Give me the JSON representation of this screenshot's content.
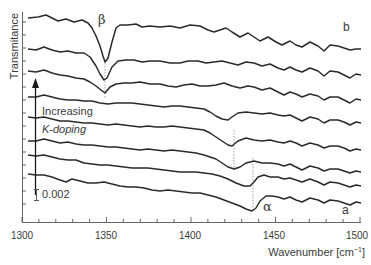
{
  "chart_data": {
    "type": "line",
    "title": "",
    "xlabel": "Wavenumber [cm−1]",
    "ylabel": "Transmitance",
    "xlim": [
      1300,
      1500
    ],
    "x_ticks": [
      1300,
      1350,
      1400,
      1450,
      1500
    ],
    "y_ticks": "unlabeled",
    "scale_bar": "0.002",
    "grid": false,
    "legend": null,
    "annotations": [
      {
        "text": "β",
        "x": 1350,
        "note": "peak near 1350 cm-1 in upper (high K-doping) spectra"
      },
      {
        "text": "α",
        "x": 1440,
        "note": "peak near 1440 cm-1 in lower (low K-doping) spectra"
      },
      {
        "text": "a",
        "position": "bottom spectrum label"
      },
      {
        "text": "b",
        "position": "top spectrum label"
      },
      {
        "text": "Increasing K-doping",
        "note": "arrow pointing upward"
      }
    ],
    "series_description": "8 vertically offset IR transmittance spectra from bottom (a) to top (b); alpha dip shifts/weakens and beta dip grows with increasing K doping",
    "series": [
      {
        "name": "b (top)",
        "offset_index": 8,
        "dip_at": 1350,
        "dip_depth": "large"
      },
      {
        "name": "7",
        "offset_index": 7,
        "dip_at": 1350,
        "dip_depth": "medium"
      },
      {
        "name": "6",
        "offset_index": 6,
        "dip_at": 1350,
        "dip_depth": "small"
      },
      {
        "name": "5",
        "offset_index": 5,
        "dip_at": 1415,
        "dip_depth": "small"
      },
      {
        "name": "4",
        "offset_index": 4,
        "dip_at": 1428,
        "dip_depth": "medium"
      },
      {
        "name": "3",
        "offset_index": 3,
        "dip_at": 1432,
        "dip_depth": "medium"
      },
      {
        "name": "2",
        "offset_index": 2,
        "dip_at": 1438,
        "dip_depth": "medium"
      },
      {
        "name": "a (bottom)",
        "offset_index": 1,
        "dip_at": 1440,
        "dip_depth": "large"
      }
    ]
  },
  "labels": {
    "ylabel": "Transmitance",
    "xlabel_main": "Wavenumber [cm",
    "xlabel_sup": "−1",
    "xlabel_close": "]",
    "beta": "β",
    "alpha": "α",
    "a": "a",
    "b": "b",
    "increasing": "Increasing",
    "kdoping": "K-doping",
    "scale": "0.002",
    "ticks": [
      "1300",
      "1350",
      "1400",
      "1450",
      "1500"
    ]
  }
}
